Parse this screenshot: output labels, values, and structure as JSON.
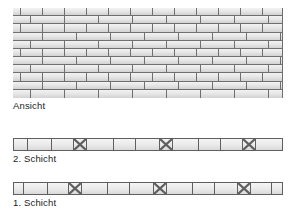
{
  "figure": {
    "background_color": "#ffffff",
    "brick_face_color": "#e9e9e9",
    "mortar_color": "#6f6f6f",
    "line_color": "#5f5f5f",
    "text_color": "#1b1b1b"
  },
  "labels": {
    "elevation": "Ansicht",
    "layer2": "2. Schicht",
    "layer1": "1. Schicht"
  },
  "elevation": {
    "name": "Ansicht",
    "bond": "running-bond",
    "course_count": 11,
    "width_px": 270,
    "height_px": 90,
    "courses": [
      {
        "offset": 0,
        "units": [
          8,
          22,
          22,
          22,
          22,
          22,
          22,
          22,
          22,
          22,
          22,
          22
        ]
      },
      {
        "offset": 1,
        "units": [
          18,
          34,
          34,
          34,
          34,
          34,
          34,
          34,
          14
        ]
      },
      {
        "offset": 0,
        "units": [
          8,
          22,
          22,
          22,
          22,
          22,
          22,
          22,
          22,
          22,
          22,
          22
        ]
      },
      {
        "offset": 1,
        "units": [
          30,
          34,
          34,
          34,
          34,
          34,
          34,
          34,
          2
        ]
      },
      {
        "offset": 0,
        "units": [
          18,
          34,
          34,
          34,
          34,
          34,
          34,
          34,
          14
        ]
      },
      {
        "offset": 1,
        "units": [
          8,
          22,
          22,
          22,
          22,
          22,
          22,
          22,
          22,
          22,
          22,
          22
        ]
      },
      {
        "offset": 0,
        "units": [
          30,
          34,
          34,
          34,
          34,
          34,
          34,
          34,
          2
        ]
      },
      {
        "offset": 1,
        "units": [
          18,
          34,
          34,
          34,
          34,
          34,
          34,
          34,
          14
        ]
      },
      {
        "offset": 0,
        "units": [
          8,
          22,
          22,
          22,
          22,
          22,
          22,
          22,
          22,
          22,
          22,
          22
        ]
      },
      {
        "offset": 1,
        "units": [
          30,
          34,
          34,
          34,
          34,
          34,
          34,
          34,
          2
        ]
      },
      {
        "offset": 0,
        "units": [
          18,
          34,
          34,
          34,
          34,
          34,
          34,
          34,
          14
        ]
      }
    ]
  },
  "layers": [
    {
      "id": "layer2",
      "label": "2. Schicht",
      "ordinal": 2,
      "width_px": 270,
      "height_px": 13,
      "cells": [
        {
          "width": 14,
          "type": "stretcher"
        },
        {
          "width": 24,
          "type": "stretcher"
        },
        {
          "width": 22,
          "type": "stretcher"
        },
        {
          "width": 13,
          "type": "header"
        },
        {
          "width": 27,
          "type": "stretcher"
        },
        {
          "width": 22,
          "type": "stretcher"
        },
        {
          "width": 24,
          "type": "stretcher"
        },
        {
          "width": 13,
          "type": "header"
        },
        {
          "width": 26,
          "type": "stretcher"
        },
        {
          "width": 22,
          "type": "stretcher"
        },
        {
          "width": 22,
          "type": "stretcher"
        },
        {
          "width": 13,
          "type": "header"
        },
        {
          "width": 26,
          "type": "stretcher"
        }
      ]
    },
    {
      "id": "layer1",
      "label": "1. Schicht",
      "ordinal": 1,
      "width_px": 270,
      "height_px": 13,
      "cells": [
        {
          "width": 10,
          "type": "stretcher"
        },
        {
          "width": 24,
          "type": "stretcher"
        },
        {
          "width": 21,
          "type": "stretcher"
        },
        {
          "width": 13,
          "type": "header"
        },
        {
          "width": 26,
          "type": "stretcher"
        },
        {
          "width": 22,
          "type": "stretcher"
        },
        {
          "width": 24,
          "type": "stretcher"
        },
        {
          "width": 13,
          "type": "header"
        },
        {
          "width": 26,
          "type": "stretcher"
        },
        {
          "width": 22,
          "type": "stretcher"
        },
        {
          "width": 23,
          "type": "stretcher"
        },
        {
          "width": 13,
          "type": "header"
        },
        {
          "width": 21,
          "type": "stretcher"
        },
        {
          "width": 12,
          "type": "stretcher"
        }
      ]
    }
  ]
}
